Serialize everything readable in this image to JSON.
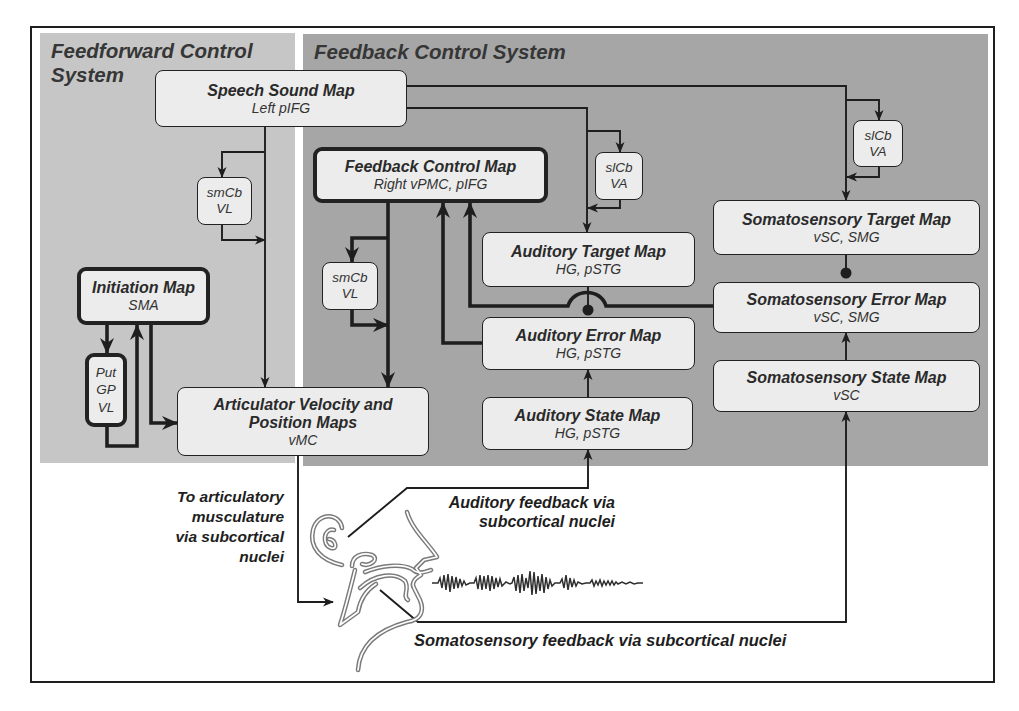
{
  "panels": {
    "feedforward": {
      "title_line1": "Feedforward Control",
      "title_line2": "System"
    },
    "feedback": {
      "title": "Feedback Control System"
    }
  },
  "boxes": {
    "speech_sound_map": {
      "title": "Speech Sound Map",
      "subtitle": "Left pIFG"
    },
    "smcb_feedforward": {
      "line1": "smCb",
      "line2": "VL"
    },
    "initiation_map": {
      "title": "Initiation Map",
      "subtitle": "SMA"
    },
    "basal_ganglia_loop": {
      "line1": "Put",
      "line2": "GP",
      "line3": "VL"
    },
    "articulator_maps": {
      "title_line1": "Articulator Velocity and",
      "title_line2": "Position Maps",
      "subtitle": "vMC"
    },
    "feedback_control_map": {
      "title": "Feedback Control Map",
      "subtitle": "Right vPMC, pIFG"
    },
    "smcb_feedback": {
      "line1": "smCb",
      "line2": "VL"
    },
    "slcb_auditory": {
      "line1": "slCb",
      "line2": "VA"
    },
    "slcb_somatosensory": {
      "line1": "slCb",
      "line2": "VA"
    },
    "auditory_target_map": {
      "title": "Auditory Target Map",
      "subtitle": "HG, pSTG"
    },
    "auditory_error_map": {
      "title": "Auditory Error Map",
      "subtitle": "HG, pSTG"
    },
    "auditory_state_map": {
      "title": "Auditory State Map",
      "subtitle": "HG, pSTG"
    },
    "somatosensory_target_map": {
      "title": "Somatosensory Target Map",
      "subtitle": "vSC, SMG"
    },
    "somatosensory_error_map": {
      "title": "Somatosensory Error Map",
      "subtitle": "vSC, SMG"
    },
    "somatosensory_state_map": {
      "title": "Somatosensory State Map",
      "subtitle": "vSC"
    }
  },
  "labels": {
    "motor_output": [
      "To articulatory",
      "musculature",
      "via subcortical",
      "nuclei"
    ],
    "auditory_feedback": [
      "Auditory feedback via",
      "subcortical nuclei"
    ],
    "somatosensory_feedback": "Somatosensory feedback via subcortical nuclei"
  },
  "colors": {
    "feedforward_panel": "#c6c6c6",
    "feedback_panel": "#a6a6a6",
    "box_fill": "#ececec",
    "line": "#1e1e1e"
  }
}
